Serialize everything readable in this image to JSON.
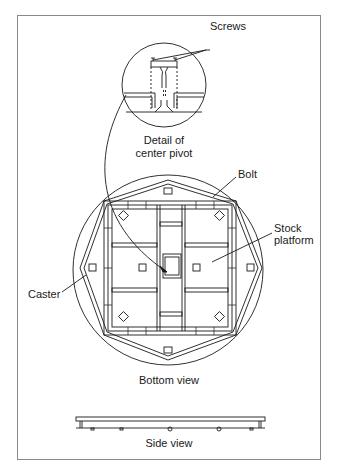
{
  "figure": {
    "labels": {
      "screws": "Screws",
      "detail_line1": "Detail of",
      "detail_line2": "center pivot",
      "bolt": "Bolt",
      "stock_line1": "Stock",
      "stock_line2": "platform",
      "caster": "Caster",
      "bottom_view": "Bottom view",
      "side_view": "Side view"
    },
    "colors": {
      "ink": "#1a1a1a",
      "frame": "#8a8a8a"
    }
  }
}
